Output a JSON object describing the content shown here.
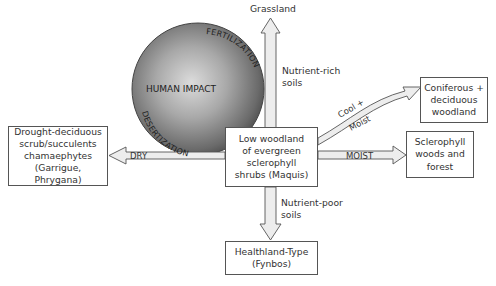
{
  "diagram": {
    "center_box": {
      "lines": [
        "Low woodland",
        "of evergreen",
        "sclerophyll",
        "shrubs (Maquis)"
      ]
    },
    "top_target": {
      "label": "Grassland"
    },
    "left_box": {
      "lines": [
        "Drought-deciduous",
        "scrub/succulents",
        "chamaephytes",
        "(Garrigue, Phrygana)"
      ]
    },
    "right_upper_box": {
      "lines": [
        "Coniferous +",
        "deciduous",
        "woodland"
      ]
    },
    "right_lower_box": {
      "lines": [
        "Sclerophyll",
        "woods and",
        "forest"
      ]
    },
    "bottom_box": {
      "lines": [
        "Healthland-Type",
        "(Fynbos)"
      ]
    },
    "arrows": {
      "up": {
        "lines": [
          "Nutrient-rich",
          "soils"
        ]
      },
      "down": {
        "lines": [
          "Nutrient-poor",
          "soils"
        ]
      },
      "left": {
        "label": "DRY"
      },
      "right": {
        "label": "MOIST"
      },
      "curved": {
        "label_top": "Cool +",
        "label_bottom": "Moist"
      }
    },
    "sphere": {
      "label": "HUMAN IMPACT",
      "arc_top_right": "FERTILIZATION",
      "arc_bottom_left": "DESERTIZATION"
    },
    "colors": {
      "sphere_light": "#d8d8d8",
      "sphere_mid": "#9a9a9a",
      "sphere_dark": "#4a4a4a",
      "arrow_fill": "#ededed",
      "stroke": "#555555",
      "text": "#333333"
    }
  }
}
